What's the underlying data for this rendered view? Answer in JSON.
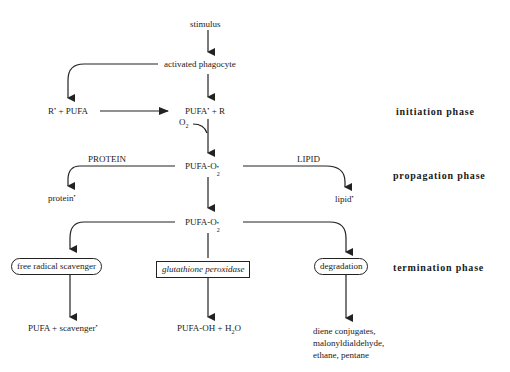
{
  "nodes": {
    "stimulus": "stimulus",
    "activated_phagocyte": "activated phagocyte",
    "r_pufa": {
      "r": "R",
      "dot": "•",
      "rest": " + PUFA"
    },
    "pufa_r": {
      "pufa": "PUFA",
      "dot": "•",
      "rest": " + R"
    },
    "o2": {
      "o": "O",
      "sub": "2"
    },
    "pufa_o2_1": {
      "base": "PUFA-O",
      "sup": "•",
      "sub": "2"
    },
    "protein_label": "PROTEIN",
    "lipid_label": "LIPID",
    "protein_radical": {
      "base": "protein",
      "sup": "•"
    },
    "lipid_radical": {
      "base": "lipid",
      "sup": "•"
    },
    "pufa_o2_2": {
      "base": "PUFA-O",
      "sup": "•",
      "sub": "2"
    },
    "free_radical_scavenger": "free radical scavenger",
    "glutathione_peroxidase": "glutathione peroxidase",
    "degradation": "degradation",
    "pufa_scavenger": {
      "base": "PUFA  + scavenger",
      "sup": "•"
    },
    "pufa_oh_h2o": {
      "base": "PUFA-OH + H",
      "sub": "2",
      "rest": "O"
    },
    "degradation_products": [
      "diene conjugates,",
      "malonyldialdehyde,",
      "ethane, pentane"
    ]
  },
  "phases": {
    "initiation": "initiation phase",
    "propagation": "propagation phase",
    "termination": "termination phase"
  },
  "colors": {
    "line": "#222222",
    "text": "#1a1a1a",
    "background": "#ffffff"
  }
}
